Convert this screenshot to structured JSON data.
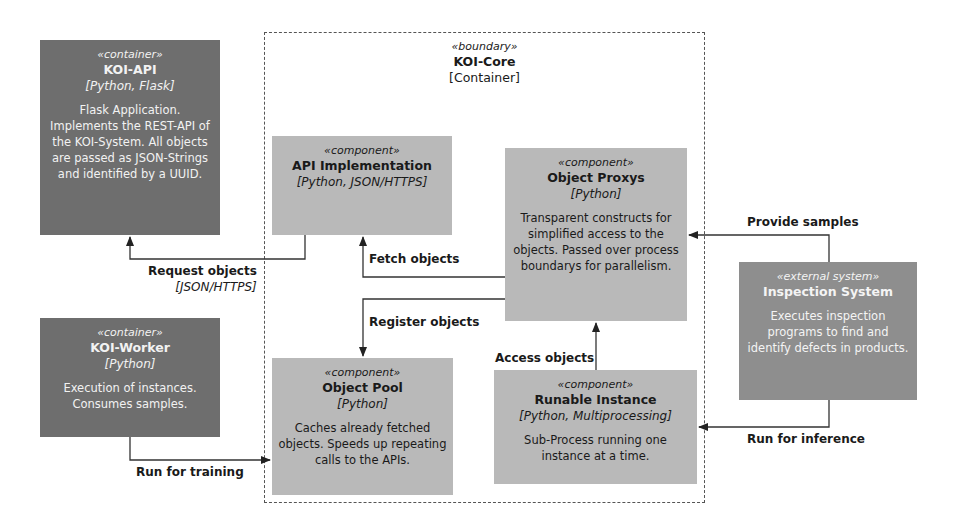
{
  "boundary": {
    "stereotype": "«boundary»",
    "title": "KOI-Core",
    "subtitle": "[Container]"
  },
  "nodes": {
    "koi_api": {
      "stereotype": "«container»",
      "title": "KOI-API",
      "tech": "[Python, Flask]",
      "description": "Flask Application. Implements the REST-API of the KOI-System. All objects are passed as JSON-Strings and identified by a UUID."
    },
    "koi_worker": {
      "stereotype": "«container»",
      "title": "KOI-Worker",
      "tech": "[Python]",
      "description": "Execution of instances. Consumes samples."
    },
    "api_impl": {
      "stereotype": "«component»",
      "title": "API Implementation",
      "tech": "[Python, JSON/HTTPS]"
    },
    "object_proxys": {
      "stereotype": "«component»",
      "title": "Object Proxys",
      "tech": "[Python]",
      "description": "Transparent constructs for simplified access to the objects. Passed over process boundarys for parallelism."
    },
    "object_pool": {
      "stereotype": "«component»",
      "title": "Object Pool",
      "tech": "[Python]",
      "description": "Caches already fetched objects. Speeds up repeating calls to the APIs."
    },
    "runable_instance": {
      "stereotype": "«component»",
      "title": "Runable Instance",
      "tech": "[Python, Multiprocessing]",
      "description": "Sub-Process running one instance at a time."
    },
    "inspection_system": {
      "stereotype": "«external system»",
      "title": "Inspection System",
      "description": "Executes inspection programs to find and identify defects in products."
    }
  },
  "edges": {
    "request_objects": {
      "label": "Request objects",
      "tech": "[JSON/HTTPS]"
    },
    "fetch_objects": {
      "label": "Fetch objects"
    },
    "register_objects": {
      "label": "Register objects"
    },
    "access_objects": {
      "label": "Access objects"
    },
    "provide_samples": {
      "label": "Provide samples"
    },
    "run_for_inference": {
      "label": "Run for inference"
    },
    "run_for_training": {
      "label": "Run for training"
    }
  },
  "colors": {
    "container": "#6e6e6e",
    "component": "#b9b9b9",
    "external_system": "#8e8e8e",
    "line": "#333333"
  }
}
